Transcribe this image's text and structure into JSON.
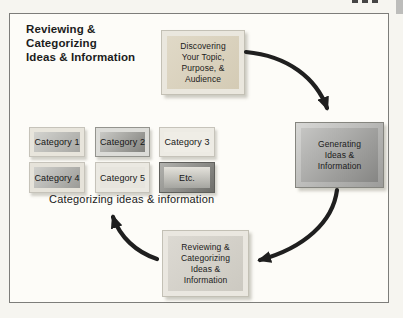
{
  "figure": {
    "title_lines": [
      "Reviewing &",
      "Categorizing",
      "Ideas & Information"
    ],
    "caption": "Categorizing ideas & information"
  },
  "nodes": {
    "discovering": {
      "lines": [
        "Discovering",
        "Your Topic,",
        "Purpose, &",
        "Audience"
      ]
    },
    "generating": {
      "lines": [
        "Generating",
        "Ideas &",
        "Information"
      ]
    },
    "reviewing": {
      "lines": [
        "Reviewing &",
        "Categorizing",
        "Ideas &",
        "Information"
      ]
    }
  },
  "categories": {
    "items": [
      {
        "label": "Category 1"
      },
      {
        "label": "Category 2"
      },
      {
        "label": "Category 3"
      },
      {
        "label": "Category 4"
      },
      {
        "label": "Category 5"
      },
      {
        "label": "Etc."
      }
    ]
  },
  "colors": {
    "arrow": "#1f1f1f",
    "discovering_fill": "#d9d1bd",
    "generating_fill": "#8a8a88",
    "reviewing_fill": "#d6d3cc",
    "frame_light": "#e9e6de",
    "figure_border": "#7d7d7a"
  }
}
